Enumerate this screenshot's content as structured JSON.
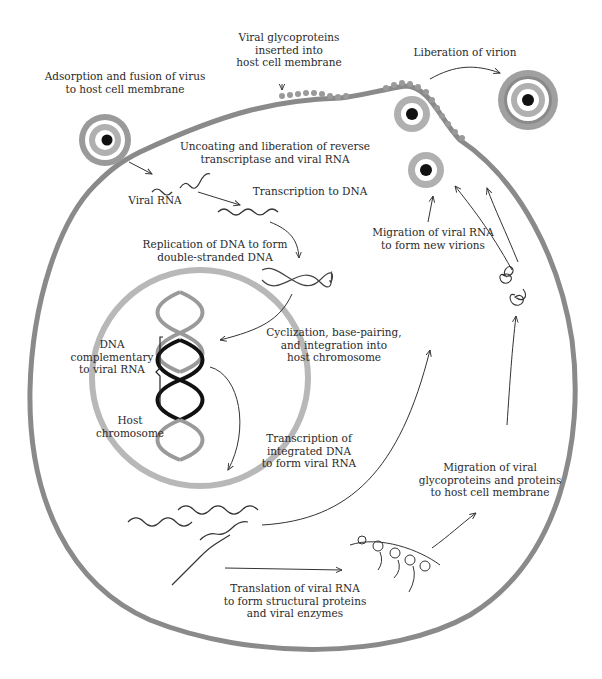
{
  "diagram": {
    "type": "retrovirus life cycle",
    "colors": {
      "membrane": "#8a8a8a",
      "nucleus": "#b8b8b8",
      "capsid_ring": "#a9a9a9",
      "core": "#111111",
      "dna_host": "#9a9a9a",
      "dna_viral": "#111111",
      "text": "#2a2a2a"
    },
    "labels": {
      "adsorption": "Adsorption and fusion of virus\nto host cell membrane",
      "glycoproteins_inserted": "Viral glycoproteins\ninserted into\nhost cell membrane",
      "liberation": "Liberation of virion",
      "uncoating": "Uncoating and liberation of reverse\ntranscriptase and viral RNA",
      "viral_rna": "Viral RNA",
      "transcription_dna": "Transcription to DNA",
      "replication": "Replication of DNA to form\ndouble-stranded DNA",
      "migration_rna": "Migration of viral RNA\nto form new virions",
      "cyclization": "Cyclization, base-pairing,\nand integration into\nhost chromosome",
      "dna_complementary": "DNA\ncomplementary\nto viral RNA",
      "host_chromosome": "Host\nchromosome",
      "transcription_integrated": "Transcription of\nintegrated DNA\nto form viral RNA",
      "migration_glyco": "Migration of viral\nglycoproteins and proteins\nto host cell membrane",
      "translation": "Translation of viral RNA\nto form structural proteins\nand viral enzymes"
    }
  }
}
